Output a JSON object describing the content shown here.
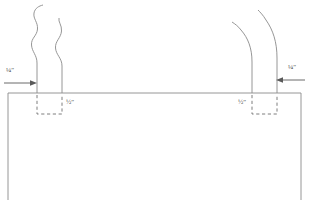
{
  "diagram": {
    "stroke_color": "#8a8a8a",
    "text_color": "#4a4a4a",
    "background_color": "#ffffff",
    "annotations": {
      "left_edge_dim": {
        "value": "¼",
        "unit": "″",
        "full": "¼″"
      },
      "right_edge_dim": {
        "value": "¼",
        "unit": "″",
        "full": "¼″"
      },
      "left_box_dim": {
        "value": "½",
        "unit": "″",
        "full": "½″"
      },
      "right_box_dim": {
        "value": "½",
        "unit": "″",
        "full": "½″"
      }
    },
    "elements": {
      "panel_label": "fabric-panel",
      "left_arrow_label": "left-dimension-arrow",
      "right_arrow_label": "right-dimension-arrow",
      "left_dashed_box_label": "left-fold-allowance-box",
      "right_dashed_box_label": "right-fold-allowance-box"
    }
  }
}
